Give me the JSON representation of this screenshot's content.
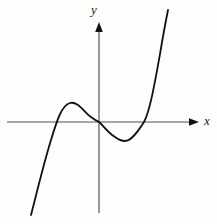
{
  "figure": {
    "kind": "cartesian-plot",
    "background_color": "#fdfdfc",
    "width": 217,
    "height": 224
  },
  "axes": {
    "x_axis": {
      "label": "x",
      "color": "#555555",
      "arrow_color": "#111111",
      "y_pixel": 122,
      "x_start_pixel": 7,
      "x_end_pixel": 199
    },
    "y_axis": {
      "label": "y",
      "color": "#555555",
      "arrow_color": "#111111",
      "x_pixel": 99,
      "y_top_pixel": 22,
      "y_bottom_pixel": 213
    },
    "origin": {
      "x": 99,
      "y": 122
    }
  },
  "chart_data": {
    "type": "line",
    "title": "",
    "xlabel": "x",
    "ylabel": "y",
    "grid": false,
    "legend": null,
    "curve_color": "#111111",
    "curve_width": 1.8,
    "features": {
      "x_intercepts": [
        -1.6,
        0.0,
        1.5
      ],
      "local_maximum": {
        "x": -0.92,
        "y": 0.6
      },
      "inflection_point": {
        "x": 0.0,
        "y": 0.0
      },
      "local_minimum": {
        "x": 0.83,
        "y": -0.6
      },
      "end_behavior": {
        "left": "decreasing to minus infinity",
        "right": "increasing to plus infinity"
      }
    },
    "axis_pixel_points": [
      [
        31,
        215
      ],
      [
        38,
        186
      ],
      [
        44,
        158
      ],
      [
        51,
        122
      ],
      [
        58,
        110
      ],
      [
        64,
        105
      ],
      [
        70,
        103
      ],
      [
        77,
        105
      ],
      [
        84,
        110
      ],
      [
        91,
        116
      ],
      [
        99,
        122
      ],
      [
        107,
        130
      ],
      [
        115,
        137
      ],
      [
        125,
        141
      ],
      [
        133,
        136
      ],
      [
        139,
        130
      ],
      [
        144,
        122
      ],
      [
        151,
        100
      ],
      [
        157,
        74
      ],
      [
        163,
        42
      ],
      [
        168,
        10
      ]
    ],
    "svg_path": "M 31,215 C 36,196 43,166 51,140 C 57,120 62,105 70,103 C 78,101 84,112 91,117 C 95,120 97,121 99,122 C 103,125 107,132 115,137 C 119,140 122,141 125,141 C 131,141 137,133 144,122 C 150,111 155,82 160,54 C 163,36 166,20 168,10"
  }
}
